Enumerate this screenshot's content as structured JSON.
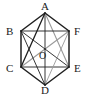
{
  "figure": {
    "kind": "geometry-diagram",
    "shape_name": "regular-hexagon",
    "caption": "",
    "background_color": "#ffffff",
    "stroke_color_dark": "#1f1f1f",
    "stroke_color_light": "#9a9a9a",
    "label_color": "#1a1a1a",
    "canvas": {
      "width": 89,
      "height": 98
    },
    "vertices": [
      {
        "id": "A",
        "label": "A",
        "x": 45,
        "y": 13,
        "label_x": 41,
        "label_y": 1
      },
      {
        "id": "B",
        "label": "B",
        "x": 21,
        "y": 31,
        "label_x": 6,
        "label_y": 26
      },
      {
        "id": "C",
        "label": "C",
        "x": 21,
        "y": 67,
        "label_x": 6,
        "label_y": 63
      },
      {
        "id": "D",
        "label": "D",
        "x": 45,
        "y": 85,
        "label_x": 41,
        "label_y": 85
      },
      {
        "id": "E",
        "label": "E",
        "x": 69,
        "y": 67,
        "label_x": 74,
        "label_y": 63
      },
      {
        "id": "F",
        "label": "F",
        "x": 69,
        "y": 31,
        "label_x": 74,
        "label_y": 26
      }
    ],
    "center": {
      "id": "O",
      "label": "O",
      "x": 45,
      "y": 49,
      "label_x": 39,
      "label_y": 51
    },
    "edges": [
      {
        "from": "A",
        "to": "B",
        "style": "dark",
        "width": 1.5
      },
      {
        "from": "B",
        "to": "C",
        "style": "dark",
        "width": 1.5
      },
      {
        "from": "C",
        "to": "D",
        "style": "dark",
        "width": 1.5
      },
      {
        "from": "D",
        "to": "E",
        "style": "dark",
        "width": 1.5
      },
      {
        "from": "E",
        "to": "F",
        "style": "dark",
        "width": 1.5
      },
      {
        "from": "F",
        "to": "A",
        "style": "dark",
        "width": 1.5
      }
    ],
    "diagonals": [
      {
        "from": "A",
        "to": "D",
        "style": "dark",
        "width": 0.9,
        "note": "main-diagonal-through-O"
      },
      {
        "from": "B",
        "to": "E",
        "style": "dark",
        "width": 0.9,
        "note": "main-diagonal-through-O"
      },
      {
        "from": "C",
        "to": "F",
        "style": "light",
        "width": 1.1,
        "note": "main-diagonal-through-O"
      },
      {
        "from": "A",
        "to": "C",
        "style": "dark",
        "width": 1.3,
        "note": "short-diagonal"
      },
      {
        "from": "A",
        "to": "E",
        "style": "light",
        "width": 1.1,
        "note": "short-diagonal"
      },
      {
        "from": "B",
        "to": "D",
        "style": "dark",
        "width": 0.9,
        "note": "short-diagonal"
      },
      {
        "from": "C",
        "to": "E",
        "style": "dark",
        "width": 0.9,
        "note": "short-diagonal"
      },
      {
        "from": "D",
        "to": "F",
        "style": "light",
        "width": 0.9,
        "note": "short-diagonal"
      },
      {
        "from": "B",
        "to": "F",
        "style": "dark",
        "width": 0.9,
        "note": "short-diagonal"
      }
    ]
  }
}
